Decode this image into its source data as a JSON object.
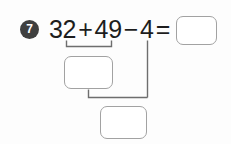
{
  "page": {
    "background_color": "#fdfdfd",
    "width": 231,
    "height": 144
  },
  "question": {
    "number_label": "7",
    "bullet_color": "#3f3f3f",
    "bullet_text_color": "#ffffff"
  },
  "equation": {
    "text_color": "#1d1d1d",
    "operand_1": "32",
    "operator_1": "+",
    "operand_2": "49",
    "operator_2": "−",
    "operand_3": "4",
    "equals": "=",
    "full_text": "32 + 49 − 4 ="
  },
  "answer_boxes": {
    "border_color": "#a2a2a2",
    "fill_color": "#ffffff",
    "result": {
      "name": "result-box",
      "value": "",
      "placeholder": ""
    },
    "partial_sum": {
      "name": "partial-sum-box",
      "value": "",
      "placeholder": ""
    },
    "final_answer": {
      "name": "final-answer-box",
      "value": "",
      "placeholder": ""
    }
  },
  "connectors": {
    "stroke_color": "#6e6e6e",
    "upper_bracket_label": "bracket grouping 32 + 49",
    "lower_bracket_label": "bracket joining partial sum and 4",
    "minuend_line_label": "vertical line from 4"
  }
}
